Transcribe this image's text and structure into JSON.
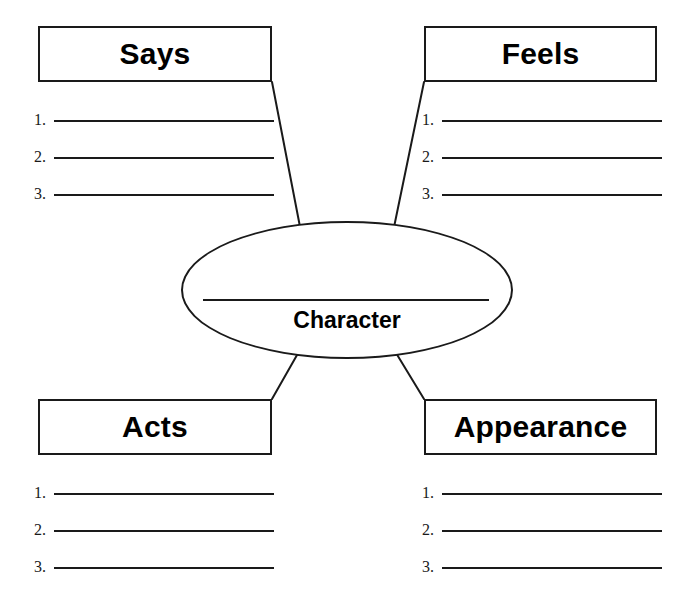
{
  "worksheet": {
    "title": "Character Graphic Organizer",
    "center": {
      "label": "Character",
      "has_write_in_line": true
    },
    "line_colors": {
      "stroke": "#1a1a1a",
      "background": "#ffffff"
    },
    "quadrants": [
      {
        "id": "says",
        "heading": "Says",
        "position": "top-left",
        "lines": [
          {
            "number": "1."
          },
          {
            "number": "2."
          },
          {
            "number": "3."
          }
        ]
      },
      {
        "id": "feels",
        "heading": "Feels",
        "position": "top-right",
        "lines": [
          {
            "number": "1."
          },
          {
            "number": "2."
          },
          {
            "number": "3."
          }
        ]
      },
      {
        "id": "acts",
        "heading": "Acts",
        "position": "bottom-left",
        "lines": [
          {
            "number": "1."
          },
          {
            "number": "2."
          },
          {
            "number": "3."
          }
        ]
      },
      {
        "id": "appearance",
        "heading": "Appearance",
        "position": "bottom-right",
        "lines": [
          {
            "number": "1."
          },
          {
            "number": "2."
          },
          {
            "number": "3."
          }
        ]
      }
    ]
  }
}
